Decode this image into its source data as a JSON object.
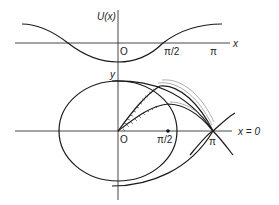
{
  "figure": {
    "top_panel": {
      "title": "Potential energy",
      "y_axis_label": "U(x)",
      "x_axis_label": "x",
      "tick_labels": {
        "origin": "O",
        "half_pi": "π/2",
        "pi": "π"
      },
      "curve": "U(x) — cosine-shaped potential well, minimum at x = 0, maxima near x = ±π"
    },
    "bottom_panel": {
      "title": "Phase plane",
      "y_axis_label": "y",
      "x_axis_annotation": "x = 0",
      "tick_labels": {
        "origin": "O",
        "half_pi": "π/2",
        "pi": "π"
      },
      "elements": [
        "closed elliptical orbit around origin",
        "separatrix curves crossing at x = π",
        "hatched trajectories emanating from origin toward π",
        "lower separatrix arc beneath the ellipse"
      ],
      "marked_point": "π/2"
    },
    "colors": {
      "line": "#1a1a1a",
      "background": "#ffffff"
    }
  }
}
